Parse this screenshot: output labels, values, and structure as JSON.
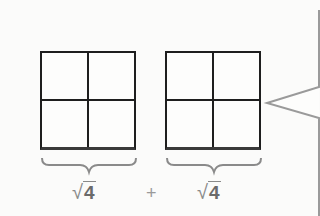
{
  "diagram": {
    "grids": [
      {
        "rows": 2,
        "cols": 2,
        "label": "4"
      },
      {
        "rows": 2,
        "cols": 2,
        "label": "4"
      }
    ],
    "labels": {
      "left_radical": "√",
      "left_radicand": "4",
      "operator": "+",
      "right_radical": "√",
      "right_radicand": "4"
    },
    "colors": {
      "grid_line": "#1e1e1e",
      "label_text": "#6a6a6a",
      "brace": "#8a8a8a",
      "bubble_outline": "#9a9a9a",
      "background": "#fbfbfa"
    }
  }
}
